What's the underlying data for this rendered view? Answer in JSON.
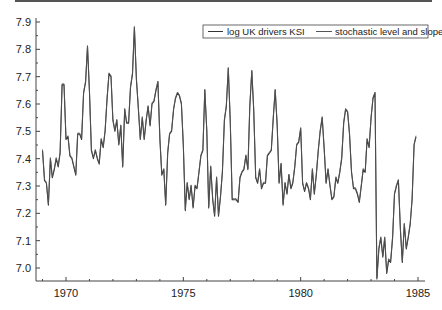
{
  "chart_data": {
    "type": "line",
    "title": "",
    "xlabel": "",
    "ylabel": "",
    "xlim": [
      1968.7,
      1985.4
    ],
    "ylim": [
      6.95,
      7.92
    ],
    "grid": false,
    "legend_position": "top-right",
    "x_ticks": [
      1970,
      1975,
      1980,
      1985
    ],
    "x_tick_labels": [
      "1970",
      "1975",
      "1980",
      "1985"
    ],
    "y_ticks": [
      7.0,
      7.1,
      7.2,
      7.3,
      7.4,
      7.5,
      7.6,
      7.7,
      7.8,
      7.9
    ],
    "y_tick_labels": [
      "7.0",
      "7.1",
      "7.2",
      "7.3",
      "7.4",
      "7.5",
      "7.6",
      "7.7",
      "7.8",
      "7.9"
    ],
    "x_start": 1969.0,
    "x_step": 0.08333,
    "series": [
      {
        "name": "log UK drivers KSI",
        "color": "#333333",
        "values": [
          7.43,
          7.32,
          7.31,
          7.23,
          7.4,
          7.33,
          7.36,
          7.4,
          7.37,
          7.42,
          7.67,
          7.67,
          7.47,
          7.48,
          7.41,
          7.4,
          7.37,
          7.34,
          7.49,
          7.49,
          7.47,
          7.64,
          7.68,
          7.81,
          7.64,
          7.43,
          7.4,
          7.43,
          7.4,
          7.38,
          7.47,
          7.44,
          7.5,
          7.62,
          7.71,
          7.7,
          7.54,
          7.5,
          7.54,
          7.45,
          7.52,
          7.37,
          7.58,
          7.53,
          7.53,
          7.66,
          7.71,
          7.88,
          7.69,
          7.58,
          7.47,
          7.55,
          7.47,
          7.54,
          7.59,
          7.52,
          7.6,
          7.61,
          7.65,
          7.68,
          7.47,
          7.34,
          7.36,
          7.23,
          7.42,
          7.49,
          7.5,
          7.58,
          7.62,
          7.64,
          7.63,
          7.6,
          7.45,
          7.21,
          7.31,
          7.25,
          7.3,
          7.22,
          7.3,
          7.29,
          7.35,
          7.41,
          7.43,
          7.65,
          7.5,
          7.22,
          7.37,
          7.25,
          7.19,
          7.33,
          7.19,
          7.26,
          7.35,
          7.54,
          7.59,
          7.73,
          7.53,
          7.25,
          7.25,
          7.25,
          7.24,
          7.33,
          7.35,
          7.36,
          7.41,
          7.36,
          7.59,
          7.72,
          7.58,
          7.33,
          7.31,
          7.36,
          7.29,
          7.31,
          7.31,
          7.41,
          7.42,
          7.43,
          7.55,
          7.65,
          7.52,
          7.31,
          7.38,
          7.23,
          7.31,
          7.27,
          7.34,
          7.29,
          7.31,
          7.37,
          7.45,
          7.46,
          7.51,
          7.31,
          7.28,
          7.31,
          7.29,
          7.25,
          7.36,
          7.27,
          7.34,
          7.43,
          7.5,
          7.55,
          7.44,
          7.31,
          7.36,
          7.3,
          7.25,
          7.26,
          7.33,
          7.31,
          7.35,
          7.4,
          7.53,
          7.58,
          7.57,
          7.49,
          7.35,
          7.29,
          7.29,
          7.27,
          7.24,
          7.3,
          7.36,
          7.35,
          7.47,
          7.44,
          7.55,
          7.62,
          7.64,
          6.96,
          7.07,
          7.11,
          7.04,
          7.11,
          6.98,
          7.03,
          7.02,
          7.11,
          7.27,
          7.3,
          7.32,
          7.14,
          7.02,
          7.16,
          7.07,
          7.11,
          7.16,
          7.25,
          7.45,
          7.48
        ]
      },
      {
        "name": "stochastic level and slope",
        "color": "#555555",
        "offset": 0.004
      }
    ]
  },
  "legend": {
    "items": [
      {
        "label": "log UK drivers KSI"
      },
      {
        "label": "stochastic level and slope"
      }
    ]
  }
}
